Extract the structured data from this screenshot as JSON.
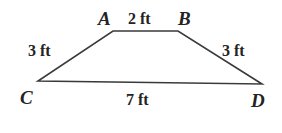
{
  "figure": {
    "name": "trapezoid-abcd",
    "shape_type": "trapezoid",
    "background_color": "#ffffff",
    "stroke_color": "#3a3a3a",
    "stroke_width": 1.6,
    "vertices": [
      {
        "id": "A",
        "label": "A",
        "x": 113,
        "y": 31
      },
      {
        "id": "B",
        "label": "B",
        "x": 178,
        "y": 31
      },
      {
        "id": "C",
        "label": "C",
        "x": 38,
        "y": 81
      },
      {
        "id": "D",
        "label": "D",
        "x": 262,
        "y": 84
      }
    ],
    "vertex_labels": {
      "a": "A",
      "b": "B",
      "c": "C",
      "d": "D"
    },
    "side_measures": {
      "ab": "2 ft",
      "ca": "3 ft",
      "bd": "3 ft",
      "cd": "7 ft"
    }
  }
}
